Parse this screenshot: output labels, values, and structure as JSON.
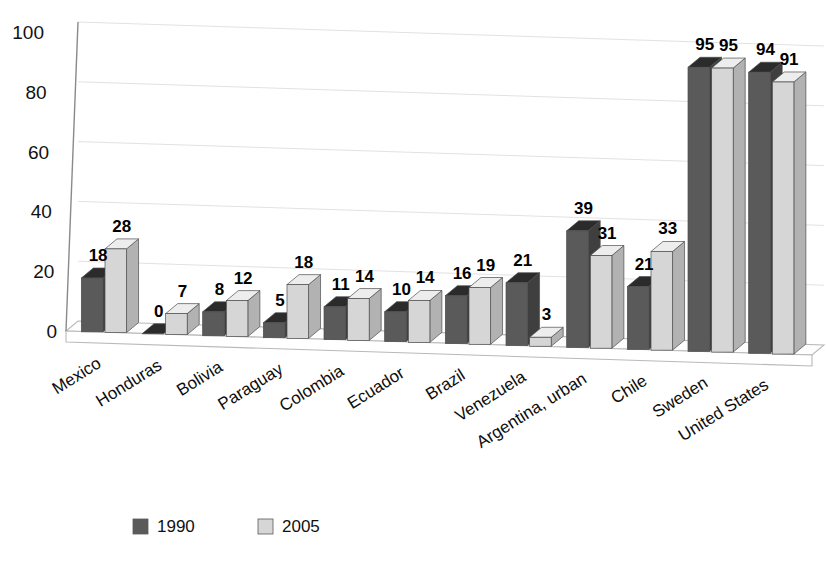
{
  "chart_data": {
    "type": "bar",
    "title": "",
    "subtitle": "",
    "xlabel": "",
    "ylabel": "",
    "ylim": [
      0,
      100
    ],
    "yticks": [
      0,
      20,
      40,
      60,
      80,
      100
    ],
    "grid": true,
    "legend_position": "bottom",
    "style": "3d-clustered-column",
    "categories": [
      "Mexico",
      "Honduras",
      "Bolivia",
      "Paraguay",
      "Colombia",
      "Ecuador",
      "Brazil",
      "Venezuela",
      "Argentina, urban",
      "Chile",
      "Sweden",
      "United States"
    ],
    "series": [
      {
        "name": "1990",
        "color": "#5a5a5a",
        "values": [
          18,
          0,
          8,
          5,
          11,
          10,
          16,
          21,
          39,
          21,
          95,
          94
        ]
      },
      {
        "name": "2005",
        "color": "#d6d6d6",
        "values": [
          28,
          7,
          12,
          18,
          14,
          14,
          19,
          3,
          31,
          33,
          95,
          91
        ]
      }
    ]
  },
  "legend": {
    "items": [
      {
        "label": "1990",
        "color": "#5a5a5a"
      },
      {
        "label": "2005",
        "color": "#d6d6d6"
      }
    ]
  },
  "colors": {
    "series_1990": "#5a5a5a",
    "series_1990_top": "#2b2b2b",
    "series_1990_side": "#3f3f3f",
    "series_2005": "#d6d6d6",
    "series_2005_top": "#ededed",
    "series_2005_side": "#b2b2b2",
    "axis": "#8a8a8a",
    "grid": "#e2e2e2",
    "floor": "#fbfbfb",
    "text": "#111111",
    "background": "#ffffff"
  }
}
